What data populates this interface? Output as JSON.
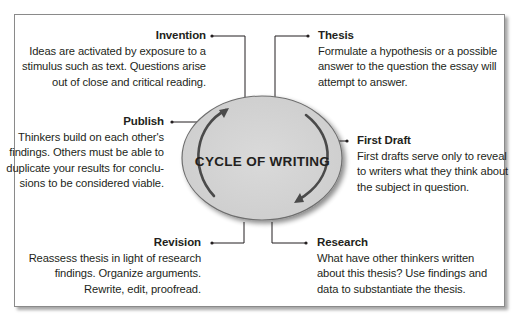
{
  "diagram": {
    "center_label": "CYCLE OF WRITING",
    "colors": {
      "ellipse_fill": "#d4d4d4",
      "ellipse_stroke": "#6e6e6e",
      "arrow": "#4a4a4a",
      "connector": "#231f20",
      "frame_border": "#8a8a8a",
      "text": "#231f20"
    },
    "stages": [
      {
        "id": "invention",
        "title": "Invention",
        "lines": [
          "Ideas are activated by exposure to a",
          "stimulus such as text. Questions arise",
          "out of close and critical reading."
        ]
      },
      {
        "id": "thesis",
        "title": "Thesis",
        "lines": [
          "Formulate a hypothesis or a possible",
          "answer to the question the essay will",
          "attempt to answer."
        ]
      },
      {
        "id": "first-draft",
        "title": "First Draft",
        "lines": [
          "First drafts serve only to reveal",
          "to writers what they think about",
          "the subject in question."
        ]
      },
      {
        "id": "research",
        "title": "Research",
        "lines": [
          "What have other thinkers written",
          "about this thesis? Use findings and",
          "data to substantiate the thesis."
        ]
      },
      {
        "id": "revision",
        "title": "Revision",
        "lines": [
          "Reassess thesis in light of research",
          "findings. Organize arguments.",
          "Rewrite, edit, proofread."
        ]
      },
      {
        "id": "publish",
        "title": "Publish",
        "lines": [
          "Thinkers build on each other's",
          "findings. Others must be able to",
          "duplicate your results for conclu-",
          "sions to be considered viable."
        ]
      }
    ]
  }
}
